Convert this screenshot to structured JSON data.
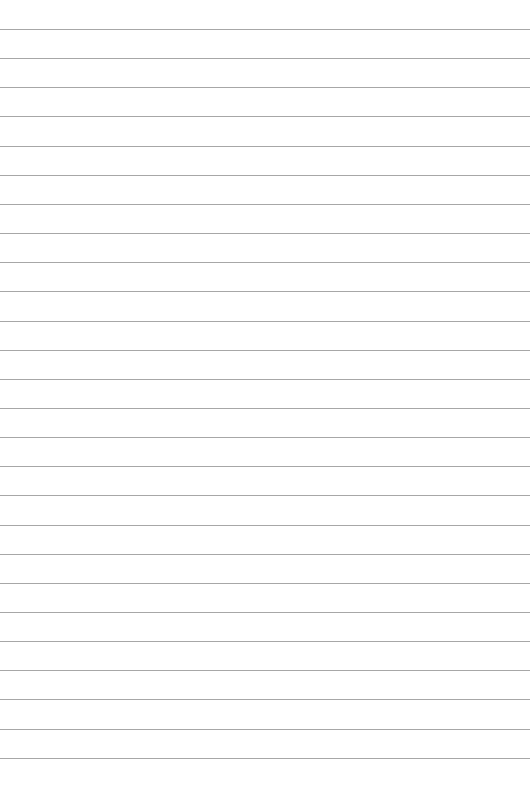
{
  "document": {
    "type": "lined-paper",
    "line_count": 26,
    "rule_color": "#8a8a8a",
    "paper_color": "#ffffff",
    "text_content": []
  }
}
